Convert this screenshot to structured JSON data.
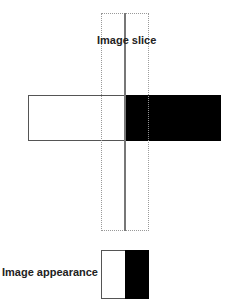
{
  "diagram": {
    "slice_label": "Image slice",
    "appearance_label": "Image appearance",
    "bar": {
      "left_color": "#ffffff",
      "right_color": "#000000"
    },
    "appearance": {
      "left_color": "#ffffff",
      "right_color": "#000000"
    }
  }
}
